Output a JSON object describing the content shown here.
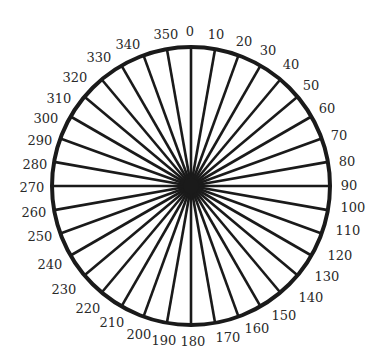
{
  "diagram": {
    "type": "degree-wheel",
    "colors": {
      "stroke": "#1a1a1a",
      "label": "#2a2a2a",
      "background": "#ffffff"
    },
    "center": [
      191,
      186
    ],
    "radius": 139,
    "spoke_interval_deg": 10,
    "labels": [
      {
        "text": "0",
        "x": 190,
        "y": 32
      },
      {
        "text": "10",
        "x": 216,
        "y": 35
      },
      {
        "text": "20",
        "x": 244,
        "y": 42
      },
      {
        "text": "30",
        "x": 268,
        "y": 51
      },
      {
        "text": "40",
        "x": 291,
        "y": 65
      },
      {
        "text": "50",
        "x": 311,
        "y": 86
      },
      {
        "text": "60",
        "x": 327,
        "y": 109
      },
      {
        "text": "70",
        "x": 339,
        "y": 136
      },
      {
        "text": "80",
        "x": 347,
        "y": 162
      },
      {
        "text": "90",
        "x": 349,
        "y": 186
      },
      {
        "text": "100",
        "x": 353,
        "y": 208
      },
      {
        "text": "110",
        "x": 348,
        "y": 231
      },
      {
        "text": "120",
        "x": 340,
        "y": 256
      },
      {
        "text": "130",
        "x": 327,
        "y": 277
      },
      {
        "text": "140",
        "x": 311,
        "y": 298
      },
      {
        "text": "150",
        "x": 284,
        "y": 316
      },
      {
        "text": "160",
        "x": 257,
        "y": 329
      },
      {
        "text": "170",
        "x": 228,
        "y": 338
      },
      {
        "text": "180",
        "x": 193,
        "y": 342
      },
      {
        "text": "190",
        "x": 164,
        "y": 341
      },
      {
        "text": "200",
        "x": 139,
        "y": 335
      },
      {
        "text": "210",
        "x": 112,
        "y": 323
      },
      {
        "text": "220",
        "x": 88,
        "y": 309
      },
      {
        "text": "230",
        "x": 64,
        "y": 290
      },
      {
        "text": "240",
        "x": 50,
        "y": 265
      },
      {
        "text": "250",
        "x": 40,
        "y": 237
      },
      {
        "text": "260",
        "x": 34,
        "y": 213
      },
      {
        "text": "270",
        "x": 32,
        "y": 188
      },
      {
        "text": "280",
        "x": 35,
        "y": 165
      },
      {
        "text": "290",
        "x": 40,
        "y": 141
      },
      {
        "text": "300",
        "x": 46,
        "y": 119
      },
      {
        "text": "310",
        "x": 59,
        "y": 99
      },
      {
        "text": "320",
        "x": 75,
        "y": 78
      },
      {
        "text": "330",
        "x": 99,
        "y": 58
      },
      {
        "text": "340",
        "x": 128,
        "y": 45
      },
      {
        "text": "350",
        "x": 166,
        "y": 35
      }
    ]
  }
}
